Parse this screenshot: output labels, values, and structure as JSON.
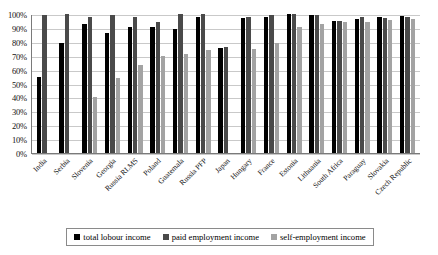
{
  "chart_data": {
    "type": "bar",
    "title": "",
    "xlabel": "",
    "ylabel": "",
    "ylim": [
      0,
      100
    ],
    "grid": true,
    "legend_position": "bottom",
    "categories": [
      "India",
      "Serbia",
      "Slovenia",
      "Georgia",
      "Russia RLMS",
      "Poland",
      "Guatemala",
      "Russia PFP",
      "Japan",
      "Hungary",
      "France",
      "Estonia",
      "Lithuania",
      "South Africa",
      "Paraguay",
      "Slovakia",
      "Czech Republic"
    ],
    "ytick_labels": [
      "100%",
      "90%",
      "80%",
      "70%",
      "60%",
      "50%",
      "40%",
      "30%",
      "20%",
      "10%",
      "0%"
    ],
    "ytick_values": [
      100,
      90,
      80,
      70,
      60,
      50,
      40,
      30,
      20,
      10,
      0
    ],
    "series": [
      {
        "name": "total lobour income",
        "color": "#000000",
        "values": [
          55,
          79,
          93,
          86.5,
          90.5,
          90.5,
          89,
          98,
          75.5,
          97,
          97.5,
          100,
          99,
          95,
          96.5,
          98,
          98.5
        ]
      },
      {
        "name": "paid employment income",
        "color": "#4a4a4a",
        "values": [
          99.5,
          100,
          98,
          99,
          98,
          94.5,
          100,
          100,
          76,
          98,
          99,
          100,
          99,
          95,
          97.5,
          97,
          98
        ]
      },
      {
        "name": "self-employment income",
        "color": "#a3a3a3",
        "values": [
          null,
          null,
          40,
          54,
          63,
          70,
          71.5,
          74,
          null,
          75,
          79,
          91,
          93,
          94,
          94.5,
          96,
          96.5
        ]
      }
    ]
  },
  "legend": {
    "items": [
      {
        "label": "total lobour income",
        "color": "#000000"
      },
      {
        "label": "paid employment income",
        "color": "#4a4a4a"
      },
      {
        "label": "self-employment income",
        "color": "#a3a3a3"
      }
    ]
  }
}
